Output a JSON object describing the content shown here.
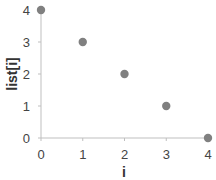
{
  "chart_data": {
    "type": "scatter",
    "title": "",
    "xlabel": "i",
    "ylabel": "list[i]",
    "x": [
      0,
      1,
      2,
      3,
      4
    ],
    "y": [
      4,
      3,
      2,
      1,
      0
    ],
    "series": [
      {
        "name": "list[i]",
        "x": [
          0,
          1,
          2,
          3,
          4
        ],
        "values": [
          4,
          3,
          2,
          1,
          0
        ],
        "color": "#808080"
      }
    ],
    "xticks": [
      "0",
      "1",
      "2",
      "3",
      "4"
    ],
    "yticks": [
      "0",
      "1",
      "2",
      "3",
      "4"
    ],
    "xlim": [
      0,
      4
    ],
    "ylim": [
      0,
      4
    ],
    "grid": false,
    "legend": null
  },
  "colors": {
    "axis": "#bfbfbf",
    "marker": "#808080"
  }
}
